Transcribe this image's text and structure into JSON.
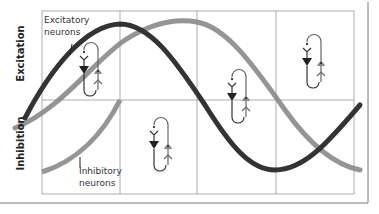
{
  "diagram": {
    "axes": {
      "top_label": "Excitation",
      "bottom_label": "Inhibition"
    },
    "curves": [
      {
        "name": "Excitatory neurons",
        "label_line1": "Excitatory",
        "label_line2": "neurons",
        "color": "#333333"
      },
      {
        "name": "Inhibitory neurons",
        "label_line1": "Inhibitory",
        "label_line2": "neurons",
        "color": "#8a8a8a"
      }
    ],
    "grid": {
      "columns": 4,
      "rows": 2,
      "line_color": "#999999"
    },
    "circuit_icons": 4,
    "colors": {
      "excitatory_neuron": "#222222",
      "inhibitory_neuron": "#888888",
      "frame": "#777777"
    }
  }
}
